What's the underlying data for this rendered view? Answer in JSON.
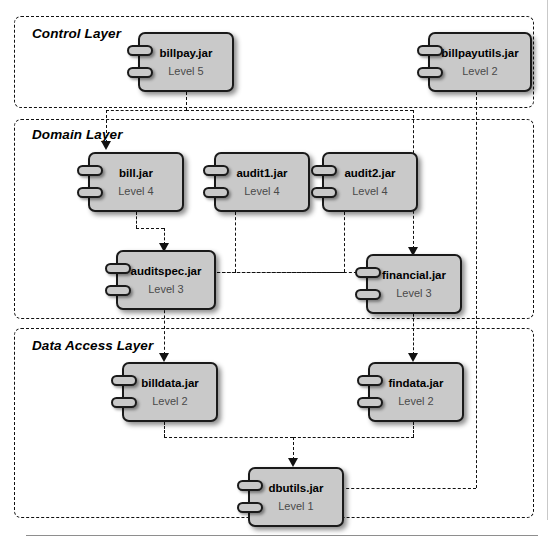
{
  "diagram": {
    "type": "uml-component-diagram",
    "colors": {
      "component_fill": "#c9c9c9",
      "component_border": "#1a1a1a",
      "layer_border": "#111111",
      "name_text": "#000000",
      "level_text": "#4a4a4a",
      "connector": "#111111",
      "background": "#ffffff"
    }
  },
  "layers": [
    {
      "id": "control",
      "label": "Control Layer"
    },
    {
      "id": "domain",
      "label": "Domain Layer"
    },
    {
      "id": "data_access",
      "label": "Data Access Layer"
    }
  ],
  "components": [
    {
      "id": "billpay",
      "name": "billpay.jar",
      "level": "Level 5",
      "level_number": 5,
      "layer": "Control Layer"
    },
    {
      "id": "billpayutils",
      "name": "billpayutils.jar",
      "level": "Level 2",
      "level_number": 2,
      "layer": "Control Layer"
    },
    {
      "id": "bill",
      "name": "bill.jar",
      "level": "Level 4",
      "level_number": 4,
      "layer": "Domain Layer"
    },
    {
      "id": "audit1",
      "name": "audit1.jar",
      "level": "Level 4",
      "level_number": 4,
      "layer": "Domain Layer"
    },
    {
      "id": "audit2",
      "name": "audit2.jar",
      "level": "Level 4",
      "level_number": 4,
      "layer": "Domain Layer"
    },
    {
      "id": "auditspec",
      "name": "auditspec.jar",
      "level": "Level 3",
      "level_number": 3,
      "layer": "Domain Layer"
    },
    {
      "id": "financial",
      "name": "financial.jar",
      "level": "Level 3",
      "level_number": 3,
      "layer": "Domain Layer"
    },
    {
      "id": "billdata",
      "name": "billdata.jar",
      "level": "Level 2",
      "level_number": 2,
      "layer": "Data Access Layer"
    },
    {
      "id": "findata",
      "name": "findata.jar",
      "level": "Level 2",
      "level_number": 2,
      "layer": "Data Access Layer"
    },
    {
      "id": "dbutils",
      "name": "dbutils.jar",
      "level": "Level 1",
      "level_number": 1,
      "layer": "Data Access Layer"
    }
  ],
  "dependencies": [
    {
      "from": "billpay",
      "to": "bill"
    },
    {
      "from": "billpay",
      "to": "financial"
    },
    {
      "from": "billpayutils",
      "to": "dbutils"
    },
    {
      "from": "bill",
      "to": "auditspec"
    },
    {
      "from": "audit1",
      "to": "auditspec"
    },
    {
      "from": "audit2",
      "to": "financial"
    },
    {
      "from": "financial",
      "to": "auditspec"
    },
    {
      "from": "auditspec",
      "to": "billdata"
    },
    {
      "from": "financial",
      "to": "findata"
    },
    {
      "from": "billdata",
      "to": "dbutils"
    },
    {
      "from": "findata",
      "to": "dbutils"
    }
  ]
}
